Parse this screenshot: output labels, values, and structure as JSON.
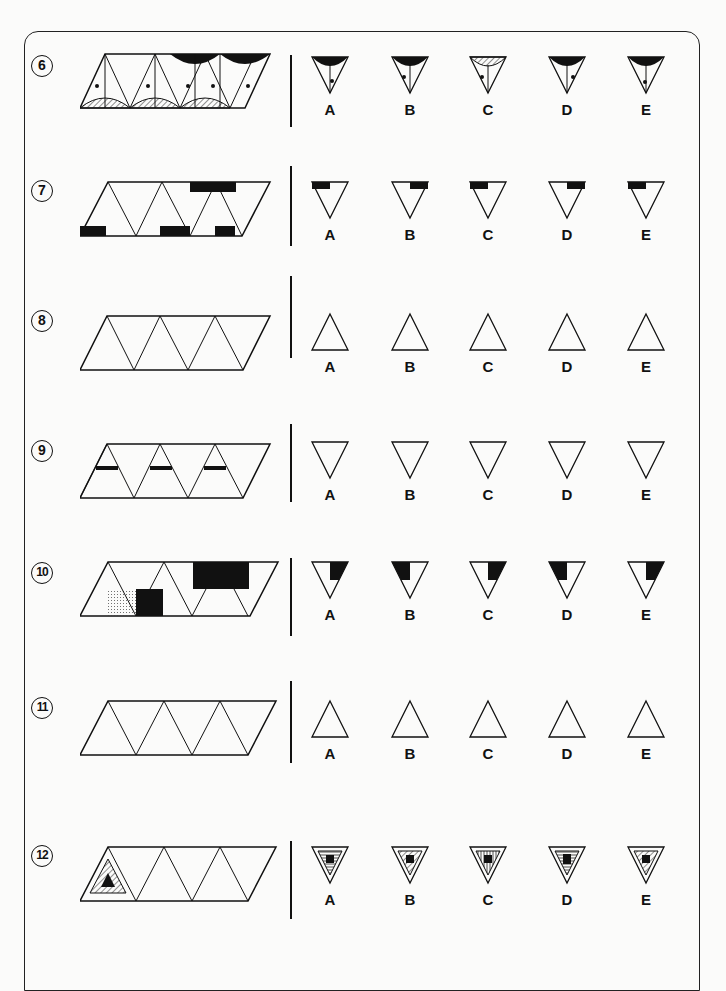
{
  "page": {
    "type": "non-verbal reasoning worksheet",
    "instruction_visible": false
  },
  "questions": [
    {
      "number": "6",
      "sequence_description": "Parallelogram strip of triangles; alternating triangles with dot and arrow, hatched semicircle on base / black semicircle on top; gap missing",
      "options": [
        {
          "label": "A",
          "description": "Inverted triangle, black semicircle top, left arrow, dot on centre line lower"
        },
        {
          "label": "B",
          "description": "Inverted triangle, black semicircle top, dot left of centre line, left arrow"
        },
        {
          "label": "C",
          "description": "Inverted triangle, hatched semicircle top, dot left, left arrow"
        },
        {
          "label": "D",
          "description": "Inverted triangle, black semicircle top, right arrow, dot right"
        },
        {
          "label": "E",
          "description": "Inverted triangle, black semicircle top, right arrow, dot on centre line lower"
        }
      ]
    },
    {
      "number": "7",
      "sequence_description": "Triangles with black band, three stripes, two ovals / two squares",
      "options": [
        {
          "label": "A",
          "description": "Black band left, stripes, two ovals right"
        },
        {
          "label": "B",
          "description": "Two squares left, black band right with stripes"
        },
        {
          "label": "C",
          "description": "Black band left with stripes, two squares right"
        },
        {
          "label": "D",
          "description": "Two ovals left, black band right with stripes"
        },
        {
          "label": "E",
          "description": "Black band left with two stripes, two squares right"
        }
      ]
    },
    {
      "number": "8",
      "sequence_description": "Triangles with dots, small circles, target circles and small squares",
      "options": [
        {
          "label": "A",
          "description": "Upright triangle, double-ring target, 2+3 squares"
        },
        {
          "label": "B",
          "description": "Upright triangle, dot, 2+2 squares"
        },
        {
          "label": "C",
          "description": "Upright triangle, single-ring target, 2+3 squares"
        },
        {
          "label": "D",
          "description": "Upright triangle, dot, 2+3 squares"
        },
        {
          "label": "E",
          "description": "Upright triangle, triple-ring target, 2+3 squares"
        }
      ]
    },
    {
      "number": "9",
      "sequence_description": "Striped peaks with brackets [ ], ( ), [( )] and loop curves",
      "options": [
        {
          "label": "A",
          "description": "Inverted triangle, [( )] dark, single loop"
        },
        {
          "label": "B",
          "description": "Inverted triangle, [( )] grey, single loop"
        },
        {
          "label": "C",
          "description": "Inverted triangle, [( )] grey, double loop"
        },
        {
          "label": "D",
          "description": "Inverted triangle, [ ] grey, single loop"
        },
        {
          "label": "E",
          "description": "Inverted triangle, [ ] dark, double loop"
        }
      ]
    },
    {
      "number": "10",
      "sequence_description": "Triangles split into dotted, black, vertical-striped and horizontal-striped regions",
      "options": [
        {
          "label": "A",
          "description": "Horizontal stripes left, black right, dotted bottom"
        },
        {
          "label": "B",
          "description": "Black left, dotted right, vertical stripes bottom"
        },
        {
          "label": "C",
          "description": "Dotted left, black right, horizontal stripes bottom"
        },
        {
          "label": "D",
          "description": "Black left, dotted right, horizontal stripes bottom"
        },
        {
          "label": "E",
          "description": "Dotted left, black right, vertical stripes bottom"
        }
      ]
    },
    {
      "number": "11",
      "sequence_description": "Triangles with circled plus signs and two-cell rectangles with dots",
      "options": [
        {
          "label": "A",
          "description": "Circled plus, rectangle top empty, bottom dot"
        },
        {
          "label": "B",
          "description": "Empty circle, rectangle top dot, bottom empty"
        },
        {
          "label": "C",
          "description": "Circled plus, rectangle both dots"
        },
        {
          "label": "D",
          "description": "Plus without circle, rectangle both dots"
        },
        {
          "label": "E",
          "description": "Empty circle, rectangle both dots"
        }
      ]
    },
    {
      "number": "12",
      "sequence_description": "Nested triangles with stripes and black centre shapes (triangle, square, pentagon, hexagon)",
      "options": [
        {
          "label": "A",
          "description": "Horizontal stripes, black pentagon"
        },
        {
          "label": "B",
          "description": "Diagonal stripes, black square"
        },
        {
          "label": "C",
          "description": "Vertical stripes, black pentagon"
        },
        {
          "label": "D",
          "description": "Horizontal stripes, black rectangle"
        },
        {
          "label": "E",
          "description": "Diagonal stripes, black hexagon"
        }
      ]
    }
  ]
}
